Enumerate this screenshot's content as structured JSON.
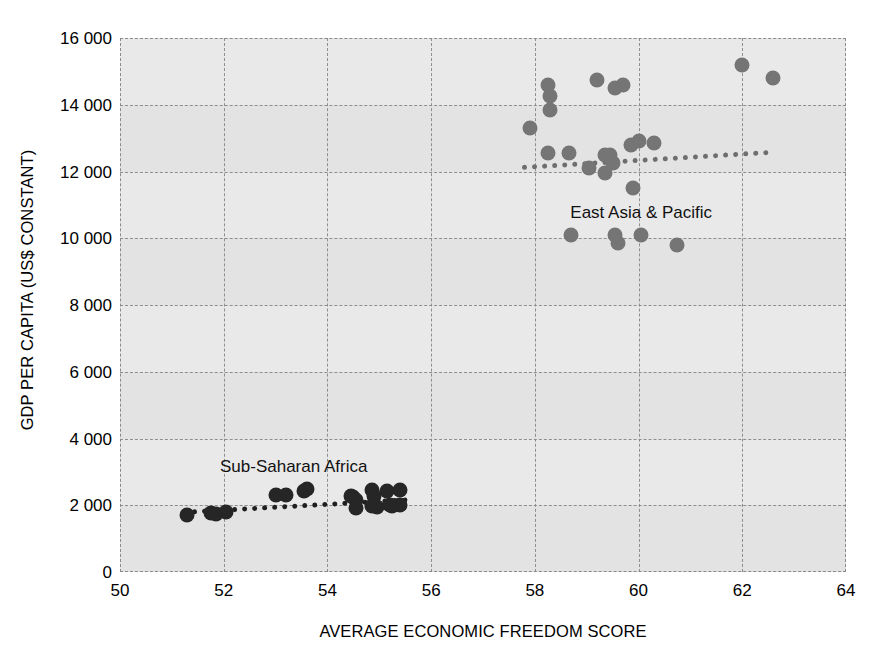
{
  "chart_data": {
    "type": "scatter",
    "title": "",
    "xlabel": "AVERAGE ECONOMIC FREEDOM SCORE",
    "ylabel": "GDP PER CAPITA (US$ CONSTANT)",
    "xlim": [
      50,
      64
    ],
    "ylim": [
      0,
      16000
    ],
    "xticks": [
      50,
      52,
      54,
      56,
      58,
      60,
      62,
      64
    ],
    "xtick_labels": [
      "50",
      "52",
      "54",
      "56",
      "58",
      "60",
      "62",
      "64"
    ],
    "yticks": [
      0,
      2000,
      4000,
      6000,
      8000,
      10000,
      12000,
      14000,
      16000
    ],
    "ytick_labels": [
      "0",
      "2 000",
      "4 000",
      "6 000",
      "8 000",
      "10 000",
      "12 000",
      "14 000",
      "16 000"
    ],
    "grid": true,
    "grid_style": "dashed",
    "legend_position": "inline-annotation",
    "series": [
      {
        "name": "East Asia & Pacific",
        "color": "#757575",
        "label_x": 60.05,
        "label_y": 10750,
        "points": [
          [
            57.9,
            13300
          ],
          [
            58.25,
            14600
          ],
          [
            58.3,
            14250
          ],
          [
            58.3,
            13850
          ],
          [
            58.25,
            12550
          ],
          [
            58.65,
            12550
          ],
          [
            58.7,
            10100
          ],
          [
            59.05,
            12100
          ],
          [
            59.2,
            14750
          ],
          [
            59.35,
            12500
          ],
          [
            59.35,
            11950
          ],
          [
            59.45,
            12500
          ],
          [
            59.5,
            12250
          ],
          [
            59.55,
            14500
          ],
          [
            59.7,
            14600
          ],
          [
            59.55,
            10100
          ],
          [
            59.6,
            9850
          ],
          [
            59.85,
            12800
          ],
          [
            59.9,
            11500
          ],
          [
            60.0,
            12900
          ],
          [
            60.3,
            12850
          ],
          [
            60.05,
            10100
          ],
          [
            60.75,
            9800
          ],
          [
            62.0,
            15200
          ],
          [
            62.6,
            14800
          ]
        ],
        "trend": {
          "x0": 57.75,
          "y0": 12200,
          "x1": 62.5,
          "y1": 12650
        }
      },
      {
        "name": "Sub-Saharan Africa",
        "color": "#262626",
        "label_x": 53.35,
        "label_y": 3150,
        "points": [
          [
            51.3,
            1700
          ],
          [
            51.75,
            1780
          ],
          [
            51.85,
            1730
          ],
          [
            52.05,
            1790
          ],
          [
            53.0,
            2320
          ],
          [
            53.2,
            2300
          ],
          [
            53.55,
            2430
          ],
          [
            53.6,
            2500
          ],
          [
            54.45,
            2280
          ],
          [
            54.5,
            2260
          ],
          [
            54.55,
            2150
          ],
          [
            54.55,
            1930
          ],
          [
            54.85,
            2470
          ],
          [
            54.9,
            2280
          ],
          [
            54.85,
            1980
          ],
          [
            54.95,
            1950
          ],
          [
            55.15,
            2420
          ],
          [
            55.2,
            2000
          ],
          [
            55.25,
            1970
          ],
          [
            55.4,
            2450
          ],
          [
            55.4,
            2000
          ]
        ],
        "trend": {
          "x0": 51.2,
          "y0": 1870,
          "x1": 55.55,
          "y1": 2250
        }
      }
    ]
  },
  "axis": {
    "x_title": "AVERAGE ECONOMIC FREEDOM SCORE",
    "y_title": "GDP PER CAPITA (US$ CONSTANT)"
  },
  "colors": {
    "plot_background": "#e9e9e9",
    "band_background": "#e3e3e3",
    "gridline": "#8e8e8e",
    "east_asia_dot": "#757575",
    "sub_saharan_dot": "#262626",
    "text": "#000000"
  }
}
